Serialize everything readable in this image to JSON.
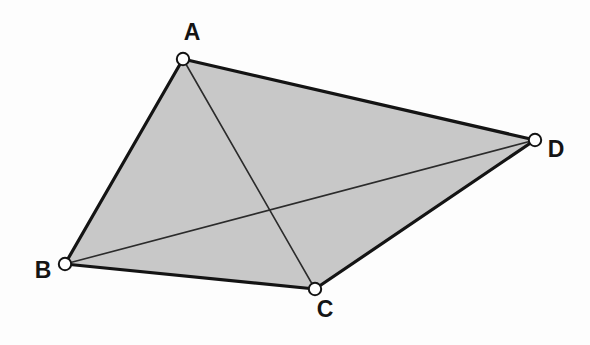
{
  "figure": {
    "canvas": {
      "width": 590,
      "height": 345
    },
    "background_color": "#fdfdfd",
    "fill_color": "#c8c8c8",
    "outline_color": "#141414",
    "diagonal_color": "#2b2b2b",
    "marker_fill": "#ffffff",
    "marker_stroke": "#141414",
    "label_color": "#141414",
    "outline_width": 3.2,
    "diagonal_width": 1.6,
    "marker_radius": 6.2,
    "marker_stroke_width": 2.0
  },
  "chart_data": {
    "type": "scatter",
    "xlabel": "",
    "ylabel": "",
    "xlim": [
      0,
      590
    ],
    "ylim": [
      0,
      345
    ],
    "grid": false,
    "legend": "none",
    "points": [
      {
        "id": "A",
        "label": "A",
        "x": 183,
        "y": 59
      },
      {
        "id": "B",
        "label": "B",
        "x": 65,
        "y": 264
      },
      {
        "id": "C",
        "label": "C",
        "x": 315,
        "y": 289
      },
      {
        "id": "D",
        "label": "D",
        "x": 535,
        "y": 140
      }
    ],
    "polygon": {
      "name": "ABCD",
      "vertex_order": [
        "A",
        "D",
        "C",
        "B"
      ],
      "filled": true
    },
    "edges": [
      {
        "id": "AD",
        "from": "A",
        "to": "D",
        "style": "thick-outline"
      },
      {
        "id": "DC",
        "from": "D",
        "to": "C",
        "style": "thick-outline"
      },
      {
        "id": "CB",
        "from": "C",
        "to": "B",
        "style": "thick-outline"
      },
      {
        "id": "BA",
        "from": "B",
        "to": "A",
        "style": "thick-outline"
      }
    ],
    "diagonals": [
      {
        "id": "AC",
        "from": "A",
        "to": "C",
        "style": "thin-interior"
      },
      {
        "id": "BD",
        "from": "B",
        "to": "D",
        "style": "thin-interior"
      }
    ],
    "intersection": {
      "id": "P",
      "label": "",
      "x": 273,
      "y": 215
    }
  },
  "labels": {
    "a": {
      "text": "A",
      "x": 192,
      "y": 34
    },
    "b": {
      "text": "B",
      "x": 43,
      "y": 272
    },
    "c": {
      "text": "C",
      "x": 325,
      "y": 311
    },
    "d": {
      "text": "D",
      "x": 556,
      "y": 151
    }
  }
}
